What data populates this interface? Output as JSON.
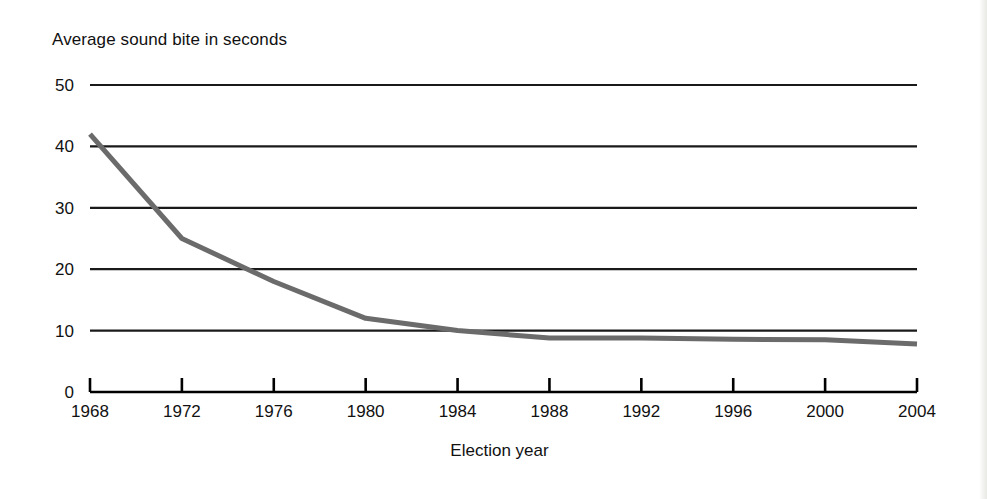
{
  "chart_data": {
    "type": "line",
    "title": "Average sound bite in seconds",
    "xlabel": "Election year",
    "ylabel": "Average sound bite in seconds",
    "x": [
      1968,
      1972,
      1976,
      1980,
      1984,
      1988,
      1992,
      1996,
      2000,
      2004
    ],
    "categories": [
      "1968",
      "1972",
      "1976",
      "1980",
      "1984",
      "1988",
      "1992",
      "1996",
      "2000",
      "2004"
    ],
    "values": [
      42,
      25,
      18,
      12,
      10,
      8.8,
      8.8,
      8.6,
      8.5,
      7.8
    ],
    "series": [
      {
        "name": "Average sound bite in seconds",
        "values": [
          42,
          25,
          18,
          12,
          10,
          8.8,
          8.8,
          8.6,
          8.5,
          7.8
        ],
        "color": "#6b6b6b"
      }
    ],
    "xlim": [
      1968,
      2004
    ],
    "ylim": [
      0,
      50
    ],
    "yticks": [
      0,
      10,
      20,
      30,
      40,
      50
    ],
    "ytick_labels": [
      "0",
      "10",
      "20",
      "30",
      "40",
      "50"
    ],
    "xticks": [
      1968,
      1972,
      1976,
      1980,
      1984,
      1988,
      1992,
      1996,
      2000,
      2004
    ],
    "xtick_labels": [
      "1968",
      "1972",
      "1976",
      "1980",
      "1984",
      "1988",
      "1992",
      "1996",
      "2000",
      "2004"
    ],
    "grid": "horizontal",
    "legend": "none",
    "line_color": "#6b6b6b",
    "grid_color": "#1a1a1a",
    "axis_color": "#000000"
  }
}
